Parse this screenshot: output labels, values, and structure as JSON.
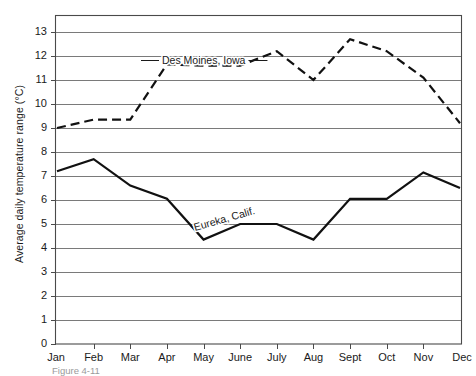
{
  "figure": {
    "caption": "Figure 4-11"
  },
  "axes": {
    "y_title": "Average daily temperature range (°C)",
    "x_title": "",
    "y_ticks": [
      "0",
      "1",
      "2",
      "3",
      "4",
      "5",
      "6",
      "7",
      "8",
      "9",
      "10",
      "11",
      "12",
      "13"
    ],
    "x_ticks": [
      "Jan",
      "Feb",
      "Mar",
      "Apr",
      "May",
      "June",
      "July",
      "Aug",
      "Sept",
      "Oct",
      "Nov",
      "Dec"
    ]
  },
  "annotations": [
    {
      "name": "des-moines-label",
      "text": "Des Moines, Iowa"
    },
    {
      "name": "eureka-label",
      "text": "Eureka,  Calif."
    }
  ],
  "colors": {
    "line": "#111111",
    "grid": "#7a7a7a",
    "frame": "#4a4a4a",
    "background": "#ffffff"
  },
  "chart_data": {
    "type": "line",
    "title": "",
    "xlabel": "",
    "ylabel": "Average daily temperature range (°C)",
    "categories": [
      "Jan",
      "Feb",
      "Mar",
      "Apr",
      "May",
      "June",
      "July",
      "Aug",
      "Sept",
      "Oct",
      "Nov",
      "Dec"
    ],
    "ylim": [
      0,
      13
    ],
    "ytick_step": 1,
    "grid": true,
    "legend": "inline-annotations",
    "series": [
      {
        "name": "Des Moines, Iowa",
        "style": "dashed",
        "values": [
          9.0,
          9.35,
          9.35,
          11.65,
          11.6,
          11.6,
          12.2,
          11.0,
          12.7,
          12.2,
          11.1,
          9.2
        ]
      },
      {
        "name": "Eureka, Calif.",
        "style": "solid",
        "values": [
          7.2,
          7.7,
          6.6,
          6.05,
          4.35,
          5.0,
          5.0,
          4.35,
          6.05,
          6.05,
          7.15,
          6.5
        ]
      }
    ]
  }
}
